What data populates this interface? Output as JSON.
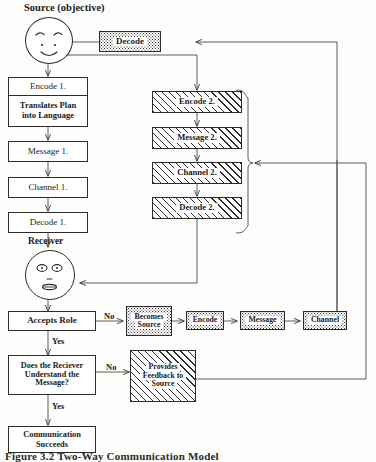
{
  "figure": {
    "title": "Source (objective)",
    "receiver_label": "Receiver",
    "caption": "Figure 3.2    Two-Way Communication Model"
  },
  "colors": {
    "ink": "#2b2b2b",
    "paper": "#fdfdfb",
    "line": "#4a4a4a"
  },
  "nodes": {
    "source_face": {
      "name": "Source face",
      "fill": "plain"
    },
    "top_decode": {
      "label": "Decode",
      "fill": "stipple"
    },
    "encode1": {
      "label": "Encode 1.",
      "sub_line1": "Translates Plan",
      "sub_line2": "into Language",
      "fill": "plain"
    },
    "message1": {
      "label": "Message 1.",
      "fill": "plain"
    },
    "channel1": {
      "label": "Channel 1.",
      "fill": "plain"
    },
    "decode1": {
      "label": "Decode 1.",
      "fill": "plain"
    },
    "receiver_face": {
      "name": "Receiver face",
      "fill": "plain"
    },
    "encode2": {
      "label": "Encode 2.",
      "fill": "hatch"
    },
    "message2": {
      "label": "Message 2.",
      "fill": "hatch"
    },
    "channel2": {
      "label": "Channel 2.",
      "fill": "hatch"
    },
    "decode2": {
      "label": "Decode 2.",
      "fill": "hatch"
    },
    "accepts_role": {
      "label": "Accepts Role",
      "fill": "plain"
    },
    "understand": {
      "line1": "Does the Reciever",
      "line2": "Understand the",
      "line3": "Message?",
      "fill": "plain"
    },
    "succeeds": {
      "line1": "Communication",
      "line2": "Succeeds",
      "fill": "plain"
    },
    "becomes_source": {
      "line1": "Becomes",
      "line2": "Source",
      "fill": "stipple"
    },
    "encode3": {
      "label": "Encode",
      "fill": "stipple"
    },
    "message3": {
      "label": "Message",
      "fill": "stipple"
    },
    "channel3": {
      "label": "Channel",
      "fill": "stipple"
    },
    "feedback": {
      "line1": "Provides",
      "line2": "Feedback to",
      "line3": "Source",
      "fill": "hatch"
    }
  },
  "edge_labels": {
    "no_role": "No",
    "yes_role": "Yes",
    "no_understand": "No",
    "yes_understand": "Yes"
  }
}
